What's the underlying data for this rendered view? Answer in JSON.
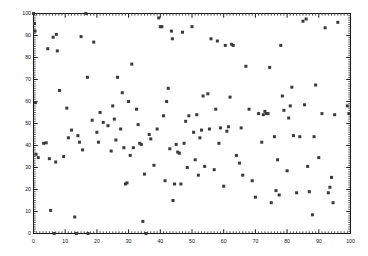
{
  "figure": {
    "background_color": "#ffffff",
    "marker_color": "#3a3a3a",
    "axis_color": "#1a1a1a"
  },
  "chart_data": {
    "type": "scatter",
    "title": "",
    "subtitle": "",
    "xlabel": "",
    "ylabel": "",
    "xlim": [
      0,
      100
    ],
    "ylim": [
      0,
      100
    ],
    "grid": false,
    "legend": null,
    "marker": "square",
    "marker_size": 3,
    "marker_color": "#3a3a3a",
    "xticks": [
      0,
      10,
      20,
      30,
      40,
      50,
      60,
      70,
      80,
      90,
      100
    ],
    "yticks": [
      0,
      10,
      20,
      30,
      40,
      50,
      60,
      70,
      80,
      90,
      100
    ],
    "xtick_labels": [
      "0",
      "10",
      "20",
      "30",
      "40",
      "50",
      "60",
      "70",
      "80",
      "90",
      "100"
    ],
    "ytick_labels": [
      "0",
      "10",
      "20",
      "30",
      "40",
      "50",
      "60",
      "70",
      "80",
      "90",
      "100"
    ],
    "minor_tick_interval": 1,
    "tick_direction": "in",
    "frame": "box",
    "n_points": 152,
    "points": [
      [
        0.0,
        100.0
      ],
      [
        0.3,
        95.5
      ],
      [
        0.5,
        92.0
      ],
      [
        0.6,
        59.5
      ],
      [
        0.8,
        36.0
      ],
      [
        1.5,
        34.5
      ],
      [
        3.2,
        41.0
      ],
      [
        4.0,
        41.2
      ],
      [
        4.5,
        84.0
      ],
      [
        5.0,
        34.0
      ],
      [
        5.4,
        10.5
      ],
      [
        6.2,
        89.2
      ],
      [
        6.5,
        0.0
      ],
      [
        7.0,
        32.5
      ],
      [
        7.2,
        90.5
      ],
      [
        7.5,
        83.0
      ],
      [
        8.2,
        65.0
      ],
      [
        9.5,
        35.0
      ],
      [
        10.5,
        57.0
      ],
      [
        11.0,
        43.5
      ],
      [
        12.0,
        47.0
      ],
      [
        13.0,
        7.5
      ],
      [
        13.5,
        0.0
      ],
      [
        14.0,
        44.5
      ],
      [
        14.5,
        41.5
      ],
      [
        15.0,
        89.5
      ],
      [
        15.5,
        38.0
      ],
      [
        16.5,
        100.0
      ],
      [
        17.0,
        71.0
      ],
      [
        17.2,
        0.0
      ],
      [
        18.5,
        51.5
      ],
      [
        19.0,
        87.0
      ],
      [
        20.0,
        46.0
      ],
      [
        20.5,
        41.5
      ],
      [
        21.0,
        55.0
      ],
      [
        22.0,
        50.5
      ],
      [
        23.5,
        49.0
      ],
      [
        24.5,
        37.5
      ],
      [
        25.0,
        58.0
      ],
      [
        25.5,
        52.0
      ],
      [
        26.0,
        42.5
      ],
      [
        26.5,
        71.0
      ],
      [
        27.5,
        47.5
      ],
      [
        28.0,
        64.0
      ],
      [
        28.5,
        39.0
      ],
      [
        29.0,
        22.5
      ],
      [
        29.5,
        23.0
      ],
      [
        30.0,
        60.0
      ],
      [
        30.5,
        35.5
      ],
      [
        31.0,
        77.0
      ],
      [
        31.5,
        39.0
      ],
      [
        32.5,
        56.5
      ],
      [
        33.0,
        49.5
      ],
      [
        33.5,
        41.0
      ],
      [
        34.0,
        40.5
      ],
      [
        34.5,
        5.5
      ],
      [
        35.0,
        27.0
      ],
      [
        35.5,
        0.0
      ],
      [
        36.5,
        45.0
      ],
      [
        37.0,
        43.0
      ],
      [
        38.0,
        31.0
      ],
      [
        39.0,
        47.5
      ],
      [
        39.5,
        98.0
      ],
      [
        40.0,
        94.0
      ],
      [
        40.5,
        94.0
      ],
      [
        41.0,
        53.5
      ],
      [
        41.5,
        24.0
      ],
      [
        42.0,
        60.0
      ],
      [
        42.5,
        66.0
      ],
      [
        43.0,
        38.5
      ],
      [
        43.5,
        92.0
      ],
      [
        43.8,
        88.5
      ],
      [
        44.0,
        15.0
      ],
      [
        44.5,
        22.5
      ],
      [
        45.0,
        40.5
      ],
      [
        45.5,
        37.0
      ],
      [
        46.0,
        36.5
      ],
      [
        46.5,
        22.5
      ],
      [
        47.0,
        91.5
      ],
      [
        47.5,
        41.0
      ],
      [
        48.0,
        51.0
      ],
      [
        48.5,
        30.0
      ],
      [
        49.0,
        53.5
      ],
      [
        50.0,
        94.0
      ],
      [
        50.5,
        46.0
      ],
      [
        51.0,
        33.5
      ],
      [
        51.5,
        54.0
      ],
      [
        52.0,
        26.5
      ],
      [
        52.5,
        43.5
      ],
      [
        53.0,
        47.0
      ],
      [
        53.5,
        62.5
      ],
      [
        54.0,
        30.5
      ],
      [
        55.0,
        63.5
      ],
      [
        55.5,
        47.5
      ],
      [
        56.0,
        88.5
      ],
      [
        57.0,
        29.0
      ],
      [
        57.5,
        56.5
      ],
      [
        58.0,
        87.5
      ],
      [
        58.5,
        41.0
      ],
      [
        59.0,
        48.0
      ],
      [
        60.0,
        21.5
      ],
      [
        60.5,
        85.5
      ],
      [
        61.0,
        46.5
      ],
      [
        61.5,
        48.5
      ],
      [
        62.0,
        62.0
      ],
      [
        62.5,
        86.0
      ],
      [
        63.0,
        85.5
      ],
      [
        64.0,
        35.5
      ],
      [
        65.0,
        32.0
      ],
      [
        65.5,
        48.0
      ],
      [
        66.0,
        26.5
      ],
      [
        67.0,
        76.0
      ],
      [
        68.0,
        56.5
      ],
      [
        69.0,
        24.0
      ],
      [
        70.0,
        16.5
      ],
      [
        71.0,
        54.5
      ],
      [
        72.0,
        41.5
      ],
      [
        72.5,
        54.0
      ],
      [
        73.0,
        55.5
      ],
      [
        73.5,
        54.5
      ],
      [
        74.0,
        54.5
      ],
      [
        74.5,
        75.5
      ],
      [
        75.0,
        14.0
      ],
      [
        76.0,
        44.0
      ],
      [
        76.5,
        19.5
      ],
      [
        77.0,
        33.5
      ],
      [
        77.5,
        17.5
      ],
      [
        78.0,
        85.5
      ],
      [
        78.5,
        62.5
      ],
      [
        79.0,
        56.0
      ],
      [
        80.0,
        28.5
      ],
      [
        80.5,
        52.5
      ],
      [
        81.0,
        58.0
      ],
      [
        81.5,
        66.5
      ],
      [
        82.0,
        44.5
      ],
      [
        83.0,
        18.5
      ],
      [
        84.0,
        44.0
      ],
      [
        85.0,
        96.5
      ],
      [
        85.5,
        58.5
      ],
      [
        86.0,
        97.5
      ],
      [
        86.5,
        30.5
      ],
      [
        87.0,
        19.0
      ],
      [
        88.0,
        8.5
      ],
      [
        88.5,
        44.0
      ],
      [
        89.0,
        67.5
      ],
      [
        90.0,
        34.5
      ],
      [
        91.0,
        54.5
      ],
      [
        92.0,
        93.5
      ],
      [
        93.0,
        18.5
      ],
      [
        93.5,
        21.0
      ],
      [
        94.0,
        25.5
      ],
      [
        94.5,
        14.0
      ],
      [
        95.0,
        54.0
      ],
      [
        96.0,
        96.0
      ],
      [
        99.0,
        58.0
      ],
      [
        99.5,
        54.5
      ]
    ]
  }
}
